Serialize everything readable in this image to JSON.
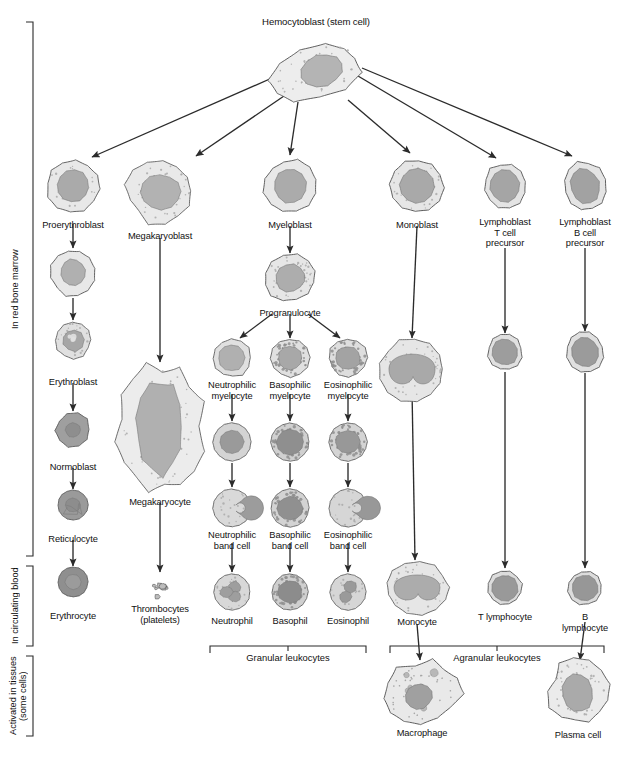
{
  "figure": {
    "title": "Hemocytoblast (stem cell)",
    "type": "hematopoiesis-flowchart"
  },
  "stage_labels": [
    {
      "id": "marrow",
      "text": "In red bone marrow"
    },
    {
      "id": "blood",
      "text": "In circulating blood"
    },
    {
      "id": "tissues",
      "text": "Activated in tissues\n(some cells)"
    }
  ],
  "group_brackets": [
    {
      "id": "granular",
      "text": "Granular leukocytes"
    },
    {
      "id": "agranular",
      "text": "Agranular leukocytes"
    }
  ],
  "cells": [
    {
      "id": "hemocytoblast",
      "label": "Hemocytoblast (stem cell)",
      "x": 316,
      "y": 72,
      "w": 92,
      "h": 52,
      "shape": "blob-wide",
      "cyto": "#ededed",
      "nuc": "#b4b4b4",
      "nucw": 0.46,
      "nuch": 0.6,
      "nucdx": 0.13,
      "nucdy": 0.02,
      "rot": -18,
      "granules": "fine",
      "labelY": 17,
      "labelAlign": "above"
    },
    {
      "id": "proerythroblast",
      "label": "Proerythroblast",
      "x": 73,
      "y": 186,
      "w": 52,
      "h": 52,
      "shape": "blob",
      "cyto": "#e8e8e8",
      "nuc": "#aaaaaa",
      "nucw": 0.62,
      "nuch": 0.62,
      "nucdx": 0.0,
      "nucdy": 0.0,
      "rot": 8,
      "granules": "sparse",
      "labelY": 220
    },
    {
      "id": "erythroblast-early",
      "label": "",
      "x": 73,
      "y": 273,
      "w": 44,
      "h": 46,
      "shape": "blob",
      "cyto": "#e8e8e8",
      "nuc": "#b0b0b0",
      "nucw": 0.56,
      "nuch": 0.58,
      "nucdx": 0.0,
      "nucdy": -0.02,
      "rot": -10,
      "granules": "none"
    },
    {
      "id": "erythroblast",
      "label": "Erythroblast",
      "x": 73,
      "y": 340,
      "w": 36,
      "h": 36,
      "shape": "blob",
      "cyto": "#e0e0e0",
      "nuc": "#a6a6a6",
      "nucw": 0.6,
      "nuch": 0.6,
      "nucdx": 0.0,
      "nucdy": 0.0,
      "rot": 0,
      "granules": "lobed",
      "labelY": 377
    },
    {
      "id": "normoblast",
      "label": "Normoblast",
      "x": 73,
      "y": 430,
      "w": 34,
      "h": 34,
      "shape": "drop",
      "cyto": "#9f9f9f",
      "nuc": "#8e8e8e",
      "nucw": 0.44,
      "nuch": 0.42,
      "nucdx": 0.0,
      "nucdy": 0.0,
      "rot": 0,
      "granules": "none",
      "labelY": 462
    },
    {
      "id": "reticulocyte",
      "label": "Reticulocyte",
      "x": 73,
      "y": 505,
      "w": 30,
      "h": 30,
      "shape": "round",
      "cyto": "#9a9a9a",
      "nuc": "#8d8d8d",
      "nucw": 0.5,
      "nuch": 0.46,
      "nucdx": 0.0,
      "nucdy": 0.0,
      "rot": 0,
      "granules": "retic",
      "labelY": 534
    },
    {
      "id": "erythrocyte",
      "label": "Erythrocyte",
      "x": 73,
      "y": 582,
      "w": 30,
      "h": 30,
      "shape": "round",
      "cyto": "#8f8f8f",
      "nuc": "#9b9b9b",
      "nucw": 0.52,
      "nuch": 0.5,
      "nucdx": 0.0,
      "nucdy": 0.0,
      "rot": 0,
      "granules": "none",
      "labelY": 611
    },
    {
      "id": "megakaryoblast",
      "label": "Megakaryoblast",
      "x": 160,
      "y": 192,
      "w": 64,
      "h": 62,
      "shape": "ameboid",
      "cyto": "#e9e9e9",
      "nuc": "#b2b2b2",
      "nucw": 0.62,
      "nuch": 0.56,
      "nucdx": 0.02,
      "nucdy": 0.0,
      "rot": 0,
      "granules": "dots",
      "labelY": 231
    },
    {
      "id": "megakaryocyte",
      "label": "Megakaryocyte",
      "x": 160,
      "y": 428,
      "w": 86,
      "h": 126,
      "shape": "ameboid-big",
      "cyto": "#ececec",
      "nuc": "#b0b0b0",
      "nucw": 0.52,
      "nuch": 0.7,
      "nucdx": -0.02,
      "nucdy": 0.0,
      "rot": 0,
      "granules": "dots",
      "labelY": 497
    },
    {
      "id": "thrombocytes",
      "label": "Thrombocytes\n(platelets)",
      "x": 160,
      "y": 590,
      "w": 28,
      "h": 24,
      "shape": "platelets",
      "cyto": "#bdbdbd",
      "nuc": "#aaaaaa",
      "nucw": 0,
      "nuch": 0,
      "nucdx": 0,
      "nucdy": 0,
      "rot": 0,
      "granules": "none",
      "labelY": 604
    },
    {
      "id": "myeloblast",
      "label": "Myeloblast",
      "x": 290,
      "y": 186,
      "w": 52,
      "h": 52,
      "shape": "blob",
      "cyto": "#e8e8e8",
      "nuc": "#ababab",
      "nucw": 0.62,
      "nuch": 0.66,
      "nucdx": 0.0,
      "nucdy": 0.0,
      "rot": -12,
      "granules": "none",
      "labelY": 220
    },
    {
      "id": "progranulocyte",
      "label": "Progranulocyte",
      "x": 290,
      "y": 278,
      "w": 52,
      "h": 46,
      "shape": "blob",
      "cyto": "#e6e6e6",
      "nuc": "#adadad",
      "nucw": 0.56,
      "nuch": 0.6,
      "nucdx": 0.0,
      "nucdy": 0.0,
      "rot": -14,
      "granules": "dots",
      "labelY": 308
    },
    {
      "id": "neutrophilic-myelocyte",
      "label": "Neutrophilic\nmyelocyte",
      "x": 232,
      "y": 358,
      "w": 38,
      "h": 38,
      "shape": "blob",
      "cyto": "#e0e0e0",
      "nuc": "#b0b0b0",
      "nucw": 0.7,
      "nuch": 0.68,
      "nucdx": -0.02,
      "nucdy": 0.0,
      "rot": 0,
      "granules": "none",
      "labelY": 380
    },
    {
      "id": "basophilic-myelocyte",
      "label": "Basophilic\nmyelocyte",
      "x": 290,
      "y": 358,
      "w": 38,
      "h": 38,
      "shape": "blob",
      "cyto": "#e0e0e0",
      "nuc": "#a8a8a8",
      "nucw": 0.62,
      "nuch": 0.62,
      "nucdx": 0.0,
      "nucdy": 0.0,
      "rot": 0,
      "granules": "coarse",
      "labelY": 380
    },
    {
      "id": "eosinophilic-myelocyte",
      "label": "Eosinophilic\nmyelocyte",
      "x": 348,
      "y": 358,
      "w": 38,
      "h": 38,
      "shape": "blob",
      "cyto": "#dedede",
      "nuc": "#a3a3a3",
      "nucw": 0.66,
      "nuch": 0.6,
      "nucdx": 0.0,
      "nucdy": 0.0,
      "rot": 0,
      "granules": "coarse",
      "labelY": 380
    },
    {
      "id": "neutrophil-mid",
      "label": "",
      "x": 232,
      "y": 442,
      "w": 38,
      "h": 38,
      "shape": "round",
      "cyto": "#d4d4d4",
      "nuc": "#9a9a9a",
      "nucw": 0.62,
      "nuch": 0.6,
      "nucdx": 0.0,
      "nucdy": 0.0,
      "rot": 0,
      "granules": "none"
    },
    {
      "id": "basophil-mid",
      "label": "",
      "x": 290,
      "y": 442,
      "w": 38,
      "h": 38,
      "shape": "round",
      "cyto": "#d0d0d0",
      "nuc": "#8f8f8f",
      "nucw": 0.7,
      "nuch": 0.66,
      "nucdx": 0.0,
      "nucdy": 0.0,
      "rot": 0,
      "granules": "coarse"
    },
    {
      "id": "eosinophil-mid",
      "label": "",
      "x": 348,
      "y": 442,
      "w": 38,
      "h": 38,
      "shape": "round",
      "cyto": "#d4d4d4",
      "nuc": "#989898",
      "nucw": 0.66,
      "nuch": 0.58,
      "nucdx": 0.0,
      "nucdy": 0.0,
      "rot": 0,
      "granules": "coarse"
    },
    {
      "id": "neutrophilic-band",
      "label": "Neutrophilic\nband cell",
      "x": 232,
      "y": 508,
      "w": 38,
      "h": 38,
      "shape": "round",
      "cyto": "#d9d9d9",
      "nuc": "#9c9c9c",
      "nucw": 0.64,
      "nuch": 0.64,
      "nucdx": 0.0,
      "nucdy": 0.0,
      "rot": 0,
      "granules": "horse",
      "labelY": 530
    },
    {
      "id": "basophilic-band",
      "label": "Basophilic\nband cell",
      "x": 290,
      "y": 508,
      "w": 38,
      "h": 38,
      "shape": "round",
      "cyto": "#d3d3d3",
      "nuc": "#909090",
      "nucw": 0.66,
      "nuch": 0.62,
      "nucdx": 0.0,
      "nucdy": 0.02,
      "rot": 0,
      "granules": "coarse",
      "labelY": 530
    },
    {
      "id": "eosinophilic-band",
      "label": "Eosinophilic\nband cell",
      "x": 348,
      "y": 508,
      "w": 38,
      "h": 38,
      "shape": "round",
      "cyto": "#d6d6d6",
      "nuc": "#989898",
      "nucw": 0.66,
      "nuch": 0.62,
      "nucdx": 0.0,
      "nucdy": 0.0,
      "rot": 0,
      "granules": "horse",
      "labelY": 530
    },
    {
      "id": "neutrophil",
      "label": "Neutrophil",
      "x": 232,
      "y": 592,
      "w": 36,
      "h": 36,
      "shape": "round",
      "cyto": "#d8d8d8",
      "nuc": "#9e9e9e",
      "nucw": 0.6,
      "nuch": 0.6,
      "nucdx": 0.0,
      "nucdy": 0.0,
      "rot": 0,
      "granules": "lobes3",
      "labelY": 616
    },
    {
      "id": "basophil",
      "label": "Basophil",
      "x": 290,
      "y": 592,
      "w": 36,
      "h": 36,
      "shape": "round",
      "cyto": "#cfcfcf",
      "nuc": "#8c8c8c",
      "nucw": 0.66,
      "nuch": 0.62,
      "nucdx": 0.0,
      "nucdy": 0.0,
      "rot": 0,
      "granules": "coarse",
      "labelY": 616
    },
    {
      "id": "eosinophil",
      "label": "Eosinophil",
      "x": 348,
      "y": 592,
      "w": 36,
      "h": 36,
      "shape": "round",
      "cyto": "#d6d6d6",
      "nuc": "#9a9a9a",
      "nucw": 0.6,
      "nuch": 0.62,
      "nucdx": 0.0,
      "nucdy": 0.0,
      "rot": 0,
      "granules": "lobes2",
      "labelY": 616
    },
    {
      "id": "monoblast",
      "label": "Monoblast",
      "x": 417,
      "y": 186,
      "w": 52,
      "h": 52,
      "shape": "blob",
      "cyto": "#e6e6e6",
      "nuc": "#a9a9a9",
      "nucw": 0.66,
      "nuch": 0.66,
      "nucdx": 0.0,
      "nucdy": 0.0,
      "rot": -24,
      "granules": "dots",
      "labelY": 220
    },
    {
      "id": "monoblast-mid",
      "label": "",
      "x": 412,
      "y": 370,
      "w": 64,
      "h": 62,
      "shape": "kidney",
      "cyto": "#e6e6e6",
      "nuc": "#a9a9a9",
      "nucw": 0.72,
      "nuch": 0.62,
      "nucdx": 0.0,
      "nucdy": -0.04,
      "rot": 0,
      "granules": "dots"
    },
    {
      "id": "monocyte",
      "label": "Monocyte",
      "x": 417,
      "y": 588,
      "w": 62,
      "h": 52,
      "shape": "kidney",
      "cyto": "#e6e6e6",
      "nuc": "#acacac",
      "nucw": 0.74,
      "nuch": 0.62,
      "nucdx": 0.0,
      "nucdy": -0.03,
      "rot": 0,
      "granules": "dots",
      "labelY": 617
    },
    {
      "id": "macrophage",
      "label": "Macrophage",
      "x": 422,
      "y": 692,
      "w": 74,
      "h": 62,
      "shape": "ameboid",
      "cyto": "#e9e9e9",
      "nuc": "#a0a0a0",
      "nucw": 0.36,
      "nuch": 0.4,
      "nucdx": -0.12,
      "nucdy": 0.1,
      "rot": -20,
      "granules": "vacuoles",
      "labelY": 728
    },
    {
      "id": "lymphoblast-t",
      "label": "Lymphoblast\nT cell\nprecursor",
      "x": 505,
      "y": 186,
      "w": 42,
      "h": 44,
      "shape": "blob",
      "cyto": "#e4e4e4",
      "nuc": "#a5a5a5",
      "nucw": 0.7,
      "nuch": 0.72,
      "nucdx": 0.0,
      "nucdy": 0.0,
      "rot": -10,
      "granules": "none",
      "labelY": 217
    },
    {
      "id": "t-lymphocyte-mid",
      "label": "",
      "x": 505,
      "y": 352,
      "w": 34,
      "h": 36,
      "shape": "blob",
      "cyto": "#e0e0e0",
      "nuc": "#9d9d9d",
      "nucw": 0.74,
      "nuch": 0.74,
      "nucdx": 0.0,
      "nucdy": 0.0,
      "rot": -12,
      "granules": "none"
    },
    {
      "id": "t-lymphocyte",
      "label": "T lymphocyte",
      "x": 505,
      "y": 588,
      "w": 34,
      "h": 34,
      "shape": "blob",
      "cyto": "#dcdcdc",
      "nuc": "#999999",
      "nucw": 0.76,
      "nuch": 0.76,
      "nucdx": 0.0,
      "nucdy": 0.0,
      "rot": -12,
      "granules": "none",
      "labelY": 612
    },
    {
      "id": "lymphoblast-b",
      "label": "Lymphoblast\nB cell\nprecursor",
      "x": 585,
      "y": 186,
      "w": 42,
      "h": 48,
      "shape": "blob",
      "cyto": "#e4e4e4",
      "nuc": "#a2a2a2",
      "nucw": 0.68,
      "nuch": 0.74,
      "nucdx": 0.0,
      "nucdy": 0.0,
      "rot": -16,
      "granules": "none",
      "labelY": 217
    },
    {
      "id": "b-lymphocyte-mid",
      "label": "",
      "x": 585,
      "y": 352,
      "w": 36,
      "h": 40,
      "shape": "blob",
      "cyto": "#e0e0e0",
      "nuc": "#9b9b9b",
      "nucw": 0.74,
      "nuch": 0.76,
      "nucdx": 0.0,
      "nucdy": 0.0,
      "rot": -14,
      "granules": "none"
    },
    {
      "id": "b-lymphocyte",
      "label": "B lymphocyte",
      "x": 585,
      "y": 588,
      "w": 34,
      "h": 34,
      "shape": "blob",
      "cyto": "#dcdcdc",
      "nuc": "#979797",
      "nucw": 0.76,
      "nuch": 0.76,
      "nucdx": 0.0,
      "nucdy": 0.0,
      "rot": -10,
      "granules": "none",
      "labelY": 612
    },
    {
      "id": "plasma-cell",
      "label": "Plasma cell",
      "x": 578,
      "y": 692,
      "w": 58,
      "h": 62,
      "shape": "ameboid",
      "cyto": "#ebebeb",
      "nuc": "#aaaaaa",
      "nucw": 0.52,
      "nuch": 0.62,
      "nucdx": -0.02,
      "nucdy": 0.02,
      "rot": -12,
      "granules": "dots",
      "labelY": 730
    }
  ],
  "arrows": [
    {
      "from": "hemocytoblast",
      "to": "proerythroblast",
      "x1": 272,
      "y1": 78,
      "x2": 92,
      "y2": 157
    },
    {
      "from": "hemocytoblast",
      "to": "megakaryoblast",
      "x1": 284,
      "y1": 96,
      "x2": 196,
      "y2": 156
    },
    {
      "from": "hemocytoblast",
      "to": "myeloblast",
      "x1": 298,
      "y1": 102,
      "x2": 290,
      "y2": 155
    },
    {
      "from": "hemocytoblast",
      "to": "monoblast",
      "x1": 348,
      "y1": 100,
      "x2": 410,
      "y2": 153
    },
    {
      "from": "hemocytoblast",
      "to": "lymphoblast-t",
      "x1": 358,
      "y1": 76,
      "x2": 496,
      "y2": 158
    },
    {
      "from": "hemocytoblast",
      "to": "lymphoblast-b",
      "x1": 362,
      "y1": 68,
      "x2": 572,
      "y2": 156
    },
    {
      "from": "proerythroblast",
      "to": "erythroblast-early",
      "x1": 73,
      "y1": 224,
      "x2": 73,
      "y2": 248
    },
    {
      "from": "erythroblast-early",
      "to": "erythroblast",
      "x1": 73,
      "y1": 298,
      "x2": 73,
      "y2": 320
    },
    {
      "from": "erythroblast",
      "to": "normoblast",
      "x1": 73,
      "y1": 383,
      "x2": 73,
      "y2": 411
    },
    {
      "from": "normoblast",
      "to": "reticulocyte",
      "x1": 73,
      "y1": 468,
      "x2": 73,
      "y2": 489
    },
    {
      "from": "reticulocyte",
      "to": "erythrocyte",
      "x1": 73,
      "y1": 540,
      "x2": 73,
      "y2": 566
    },
    {
      "from": "megakaryoblast",
      "to": "megakaryocyte",
      "x1": 160,
      "y1": 238,
      "x2": 160,
      "y2": 362
    },
    {
      "from": "megakaryocyte",
      "to": "thrombocytes",
      "x1": 160,
      "y1": 503,
      "x2": 160,
      "y2": 572
    },
    {
      "from": "myeloblast",
      "to": "progranulocyte",
      "x1": 290,
      "y1": 226,
      "x2": 290,
      "y2": 253
    },
    {
      "from": "progranulocyte",
      "to": "neutrophilic-myelocyte",
      "x1": 272,
      "y1": 314,
      "x2": 240,
      "y2": 338
    },
    {
      "from": "progranulocyte",
      "to": "basophilic-myelocyte",
      "x1": 290,
      "y1": 314,
      "x2": 290,
      "y2": 338
    },
    {
      "from": "progranulocyte",
      "to": "eosinophilic-myelocyte",
      "x1": 308,
      "y1": 314,
      "x2": 340,
      "y2": 338
    },
    {
      "from": "neutrophilic-myelocyte",
      "to": "neutrophil-mid",
      "x1": 232,
      "y1": 394,
      "x2": 232,
      "y2": 421
    },
    {
      "from": "basophilic-myelocyte",
      "to": "basophil-mid",
      "x1": 290,
      "y1": 394,
      "x2": 290,
      "y2": 421
    },
    {
      "from": "eosinophilic-myelocyte",
      "to": "eosinophil-mid",
      "x1": 348,
      "y1": 394,
      "x2": 348,
      "y2": 421
    },
    {
      "from": "neutrophil-mid",
      "to": "neutrophilic-band",
      "x1": 232,
      "y1": 463,
      "x2": 232,
      "y2": 487
    },
    {
      "from": "basophil-mid",
      "to": "basophilic-band",
      "x1": 290,
      "y1": 463,
      "x2": 290,
      "y2": 487
    },
    {
      "from": "eosinophil-mid",
      "to": "eosinophilic-band",
      "x1": 348,
      "y1": 463,
      "x2": 348,
      "y2": 487
    },
    {
      "from": "neutrophilic-band",
      "to": "neutrophil",
      "x1": 232,
      "y1": 543,
      "x2": 232,
      "y2": 572
    },
    {
      "from": "basophilic-band",
      "to": "basophil",
      "x1": 290,
      "y1": 543,
      "x2": 290,
      "y2": 572
    },
    {
      "from": "eosinophilic-band",
      "to": "eosinophil",
      "x1": 348,
      "y1": 543,
      "x2": 348,
      "y2": 572
    },
    {
      "from": "monoblast",
      "to": "monoblast-mid",
      "x1": 417,
      "y1": 226,
      "x2": 412,
      "y2": 338
    },
    {
      "from": "monoblast-mid",
      "to": "monocyte",
      "x1": 412,
      "y1": 390,
      "x2": 415,
      "y2": 560
    },
    {
      "from": "monocyte",
      "to": "macrophage",
      "x1": 417,
      "y1": 624,
      "x2": 420,
      "y2": 660
    },
    {
      "from": "lymphoblast-t",
      "to": "t-lymphocyte-mid",
      "x1": 505,
      "y1": 248,
      "x2": 505,
      "y2": 333
    },
    {
      "from": "t-lymphocyte-mid",
      "to": "t-lymphocyte",
      "x1": 505,
      "y1": 372,
      "x2": 505,
      "y2": 568
    },
    {
      "from": "lymphoblast-b",
      "to": "b-lymphocyte-mid",
      "x1": 585,
      "y1": 248,
      "x2": 585,
      "y2": 331
    },
    {
      "from": "b-lymphocyte-mid",
      "to": "b-lymphocyte",
      "x1": 585,
      "y1": 373,
      "x2": 585,
      "y2": 568
    },
    {
      "from": "b-lymphocyte",
      "to": "plasma-cell",
      "x1": 585,
      "y1": 622,
      "x2": 580,
      "y2": 660
    }
  ]
}
